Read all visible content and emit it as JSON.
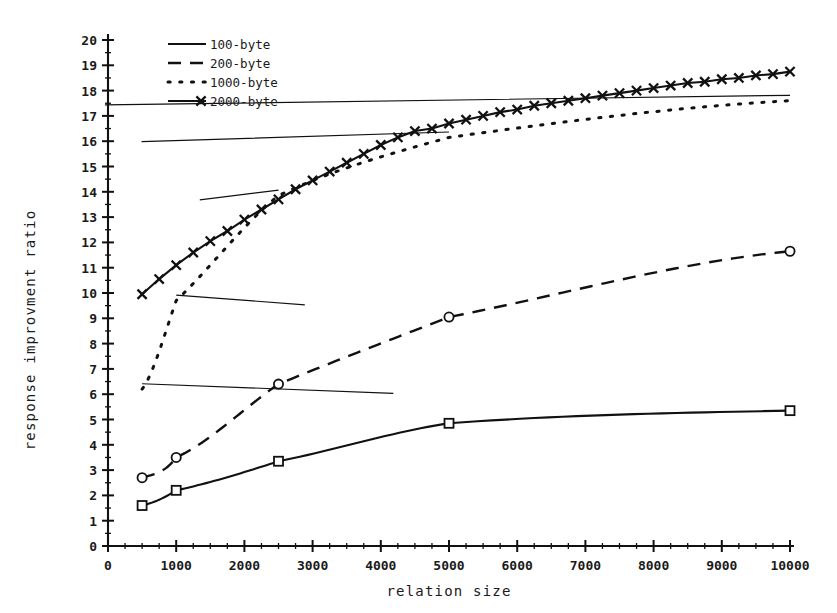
{
  "chart_data": {
    "type": "line",
    "title": "",
    "xlabel": "relation size",
    "ylabel": "response improvment ratio",
    "xlim": [
      0,
      10000
    ],
    "ylim": [
      0,
      20
    ],
    "grid": false,
    "legend_position": "top-left",
    "x_ticks": [
      0,
      1000,
      2000,
      3000,
      4000,
      5000,
      6000,
      7000,
      8000,
      9000,
      10000
    ],
    "x_tick_labels": [
      "0",
      "1000",
      "2000",
      "3000",
      "4000",
      "5000",
      "6000",
      "7000",
      "8000",
      "9000",
      "10000"
    ],
    "y_ticks": [
      0,
      1,
      2,
      3,
      4,
      5,
      6,
      7,
      8,
      9,
      10,
      11,
      12,
      13,
      14,
      15,
      16,
      17,
      18,
      19,
      20
    ],
    "y_tick_labels": [
      "0",
      "1",
      "2",
      "3",
      "4",
      "5",
      "6",
      "7",
      "8",
      "9",
      "10",
      "11",
      "12",
      "13",
      "14",
      "15",
      "16",
      "17",
      "18",
      "19",
      "20"
    ],
    "x_minor_interval": 250,
    "y_minor_interval": 0.5,
    "series": [
      {
        "name": "100-byte",
        "line_style": "solid",
        "marker": "square",
        "color": "#111111",
        "x": [
          500,
          1000,
          2500,
          5000,
          10000
        ],
        "values": [
          1.6,
          2.2,
          3.35,
          4.85,
          5.35
        ]
      },
      {
        "name": "200-byte",
        "line_style": "dashed",
        "marker": "circle",
        "color": "#111111",
        "x": [
          500,
          1000,
          2500,
          5000,
          10000
        ],
        "values": [
          2.7,
          3.5,
          6.4,
          9.05,
          11.65
        ]
      },
      {
        "name": "1000-byte",
        "line_style": "dotted",
        "marker": "triangle",
        "color": "#111111",
        "x": [
          500,
          1000,
          2500,
          5000,
          10000
        ],
        "values": [
          6.2,
          9.7,
          13.85,
          16.15,
          17.6
        ]
      },
      {
        "name": "2000-byte",
        "line_style": "solid",
        "marker": "x",
        "color": "#111111",
        "x": [
          500,
          750,
          1000,
          1250,
          1500,
          1750,
          2000,
          2250,
          2500,
          2750,
          3000,
          3250,
          3500,
          3750,
          4000,
          4250,
          4500,
          4750,
          5000,
          5250,
          5500,
          5750,
          6000,
          6250,
          6500,
          6750,
          7000,
          7250,
          7500,
          7750,
          8000,
          8250,
          8500,
          8750,
          9000,
          9250,
          9500,
          9750,
          10000
        ],
        "values": [
          9.95,
          10.55,
          11.1,
          11.6,
          12.05,
          12.45,
          12.9,
          13.3,
          13.7,
          14.1,
          14.45,
          14.8,
          15.15,
          15.5,
          15.85,
          16.15,
          16.4,
          16.5,
          16.7,
          16.85,
          17.0,
          17.15,
          17.25,
          17.4,
          17.5,
          17.6,
          17.7,
          17.8,
          17.9,
          18.0,
          18.1,
          18.2,
          18.3,
          18.35,
          18.45,
          18.5,
          18.6,
          18.65,
          18.75
        ]
      }
    ]
  },
  "legend": {
    "entries": [
      {
        "label": "100-byte",
        "style": "solid",
        "marker": "none"
      },
      {
        "label": "200-byte",
        "style": "dashed",
        "marker": "none"
      },
      {
        "label": "1000-byte",
        "style": "dotted",
        "marker": "none"
      },
      {
        "label": "2000-byte",
        "style": "solid",
        "marker": "x"
      }
    ]
  },
  "axes": {
    "x_title": "relation size",
    "y_title": "response improvment ratio"
  }
}
